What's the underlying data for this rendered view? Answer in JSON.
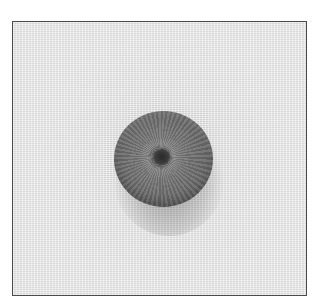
{
  "image": {
    "subject": "embroidered circular eyelet on textured fabric",
    "style": "grayscale photograph",
    "colors": {
      "frame_border": "#4a4a4a",
      "fabric": "#e6e6e6",
      "disc": "#6e6e6e",
      "hole": "#2a2a2a"
    }
  }
}
